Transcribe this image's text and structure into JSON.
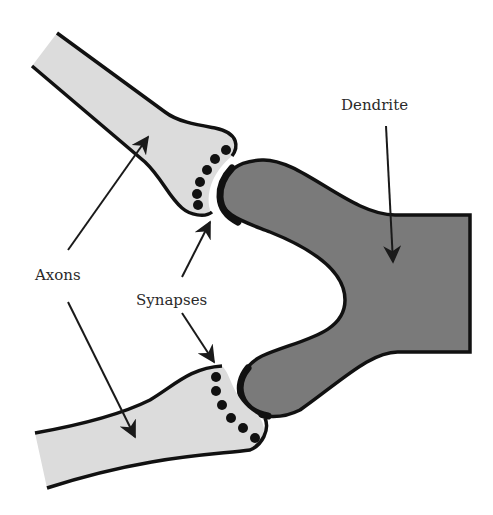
{
  "diagram": {
    "labels": {
      "dendrite": "Dendrite",
      "axons": "Axons",
      "synapses": "Synapses"
    },
    "colors": {
      "axon_fill": "#dcdcdc",
      "dendrite_fill": "#7a7a7a",
      "outline": "#111111",
      "arrow": "#1a1a1a"
    },
    "nodes": [
      {
        "id": "axon-top",
        "label": "Axon (upper)"
      },
      {
        "id": "axon-bottom",
        "label": "Axon (lower)"
      },
      {
        "id": "dendrite",
        "label": "Dendrite"
      }
    ],
    "edges": [
      {
        "from": "axons",
        "to": "axon-top",
        "type": "pointer-arrow"
      },
      {
        "from": "axons",
        "to": "axon-bottom",
        "type": "pointer-arrow"
      },
      {
        "from": "synapses",
        "to": "synapse-top",
        "type": "pointer-arrow"
      },
      {
        "from": "synapses",
        "to": "synapse-bottom",
        "type": "pointer-arrow"
      },
      {
        "from": "dendrite-label",
        "to": "dendrite",
        "type": "pointer-arrow"
      }
    ]
  }
}
